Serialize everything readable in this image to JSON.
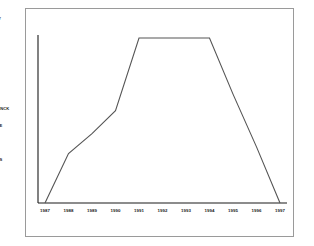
{
  "page": {
    "background_color": "#ffffff",
    "frame_color": "#9a9a9a"
  },
  "artist_list": {
    "name": "artist-name-column",
    "note_clipped": "labels run off the left edge of the viewport",
    "items": [
      {
        "lines": [
          "AUL",
          "ARTNEY"
        ]
      },
      {
        "lines": [
          "LTON",
          "N"
        ]
      },
      {
        "lines": [
          "R",
          "HER"
        ]
      },
      {
        "lines": [
          "H",
          "HARDS"
        ]
      },
      {
        "lines": [
          "JONES"
        ]
      },
      {
        "lines": [
          "LBERT",
          "MPERDINCK"
        ]
      },
      {
        "lines": [
          "D BOWIE"
        ]
      },
      {
        "lines": [
          "G"
        ]
      },
      {
        "lines": [
          "COLLINS"
        ]
      },
      {
        "lines": [
          "IE",
          "AMS"
        ]
      }
    ]
  },
  "chart_data": {
    "type": "line",
    "title": "",
    "xlabel": "",
    "ylabel": "",
    "grid": false,
    "legend": "none",
    "line_color": "#555555",
    "axis_color": "#1a1a1a",
    "x": [
      "1987",
      "1988",
      "1989",
      "1990",
      "1991",
      "1992",
      "1993",
      "1994",
      "1995",
      "1996",
      "1997"
    ],
    "xlim": [
      "1987",
      "1997"
    ],
    "ylim": [
      0,
      100
    ],
    "series": [
      {
        "name": "value",
        "values": [
          0,
          30,
          42,
          56,
          100,
          100,
          100,
          100,
          66,
          34,
          0
        ]
      }
    ]
  }
}
